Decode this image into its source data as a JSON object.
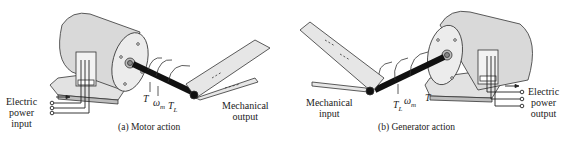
{
  "panels": [
    {
      "caption": "(a) Motor action",
      "electric_label": [
        "Electric",
        "power",
        "input"
      ],
      "mechanical_label": [
        "Mechanical",
        "output"
      ],
      "symbols": {
        "torque": "T",
        "speed": "ω",
        "speed_sub": "m",
        "load_torque": "T",
        "load_torque_sub": "L"
      }
    },
    {
      "caption": "(b) Generator action",
      "electric_label": [
        "Electric",
        "power",
        "output"
      ],
      "mechanical_label": [
        "Mechanical",
        "input"
      ],
      "symbols": {
        "torque": "T",
        "speed": "ω",
        "speed_sub": "m",
        "load_torque": "T",
        "load_torque_sub": "L"
      }
    }
  ],
  "colors": {
    "body": "#d9d9d9",
    "shaft": "#111111",
    "line": "#333333",
    "belt": "#e6e6e6"
  }
}
